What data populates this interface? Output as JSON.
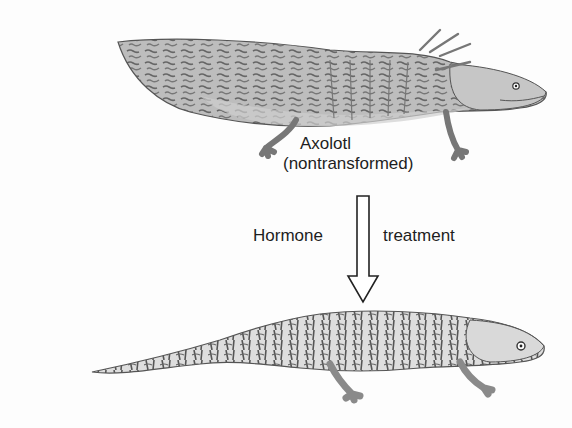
{
  "diagram": {
    "top_organism": {
      "name_line1": "Axolotl",
      "name_line2": "(nontransformed)"
    },
    "arrow": {
      "label_left": "Hormone",
      "label_right": "treatment",
      "direction": "down"
    },
    "bottom_organism": {
      "name": "transformed salamander (unlabeled)"
    },
    "colors": {
      "body_light": "#c9c9c9",
      "body_dark": "#6e6e6e",
      "text": "#1e1e1e",
      "background": "#fdfdfd"
    }
  }
}
